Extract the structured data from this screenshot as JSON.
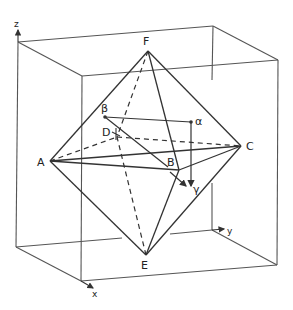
{
  "diagram": {
    "stroke_color": "#333333",
    "box_color": "#555555",
    "axes": {
      "z": {
        "label": "z"
      },
      "x": {
        "label": "x"
      },
      "y": {
        "label": "y"
      }
    },
    "vertices": {
      "A": {
        "label": "A"
      },
      "B": {
        "label": "B"
      },
      "C": {
        "label": "C"
      },
      "D": {
        "label": "D"
      },
      "E": {
        "label": "E"
      },
      "F": {
        "label": "F"
      }
    },
    "vectors": {
      "alpha": {
        "label": "α"
      },
      "beta": {
        "label": "β"
      },
      "gamma": {
        "label": "γ"
      }
    }
  }
}
